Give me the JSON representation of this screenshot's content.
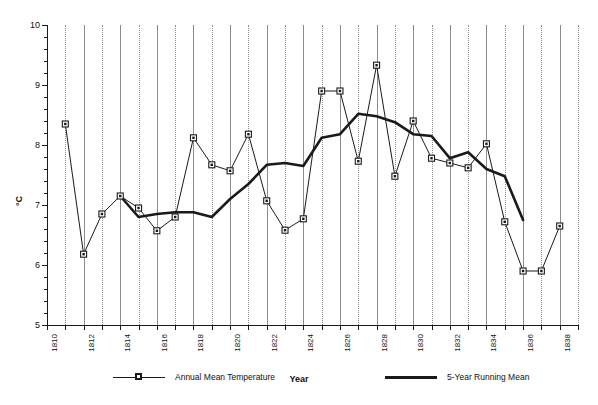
{
  "chart_data": {
    "type": "line",
    "title": "",
    "xlabel": "Year",
    "ylabel": "°C",
    "xlim": [
      1810,
      1839
    ],
    "ylim": [
      5,
      10
    ],
    "ytick_step": 1,
    "yticks": [
      5,
      6,
      7,
      8,
      9,
      10
    ],
    "ytick_labels": [
      "5",
      "6",
      "7",
      "8",
      "9",
      "10"
    ],
    "yminor_step": 0.2,
    "xticks": [
      1810,
      1811,
      1812,
      1813,
      1814,
      1815,
      1816,
      1817,
      1818,
      1819,
      1820,
      1821,
      1822,
      1823,
      1824,
      1825,
      1826,
      1827,
      1828,
      1829,
      1830,
      1831,
      1832,
      1833,
      1834,
      1835,
      1836,
      1837,
      1838,
      1839
    ],
    "xtick_labels": [
      "1810",
      "1812",
      "1814",
      "1816",
      "1818",
      "1820",
      "1822",
      "1824",
      "1826",
      "1828",
      "1830",
      "1832",
      "1834",
      "1836",
      "1838"
    ],
    "xtick_label_years": [
      1810,
      1812,
      1814,
      1816,
      1818,
      1820,
      1822,
      1824,
      1826,
      1828,
      1830,
      1832,
      1834,
      1836,
      1838
    ],
    "grid": "vertical",
    "grid_color": "#8d8d8d",
    "grid_style_even": "solid",
    "grid_style_odd": "dotted",
    "legend_position": "below-axis",
    "x": [
      1811,
      1812,
      1813,
      1814,
      1815,
      1816,
      1817,
      1818,
      1819,
      1820,
      1821,
      1822,
      1823,
      1824,
      1825,
      1826,
      1827,
      1828,
      1829,
      1830,
      1831,
      1832,
      1833,
      1834,
      1835,
      1836,
      1837,
      1838
    ],
    "series": [
      {
        "name": "Annual Mean Temperature",
        "style": "thin-line-with-square-markers",
        "color": "#1a1a1a",
        "values": [
          8.35,
          6.18,
          6.85,
          7.15,
          6.95,
          6.57,
          6.8,
          8.12,
          7.67,
          7.57,
          8.18,
          7.07,
          6.58,
          6.77,
          8.9,
          8.9,
          7.73,
          9.33,
          7.48,
          8.4,
          7.78,
          7.7,
          7.62,
          8.02,
          6.72,
          5.9,
          5.9,
          6.65
        ]
      },
      {
        "name": "5-Year Running Mean",
        "style": "thick-line",
        "color": "#1a1a1a",
        "x": [
          1814,
          1815,
          1816,
          1817,
          1818,
          1819,
          1820,
          1821,
          1822,
          1823,
          1824,
          1825,
          1826,
          1827,
          1828,
          1829,
          1830,
          1831,
          1832,
          1833,
          1834,
          1835,
          1836
        ],
        "values": [
          7.15,
          6.8,
          6.85,
          6.88,
          6.88,
          6.8,
          7.1,
          7.35,
          7.67,
          7.7,
          7.65,
          8.12,
          8.18,
          8.52,
          8.48,
          8.38,
          8.18,
          8.15,
          7.78,
          7.88,
          7.6,
          7.48,
          6.75
        ]
      }
    ]
  },
  "legend": {
    "annual_label": "Annual Mean Temperature",
    "running_label": "5-Year Running Mean"
  },
  "axes": {
    "y_title": "°C",
    "x_title": "Year"
  }
}
